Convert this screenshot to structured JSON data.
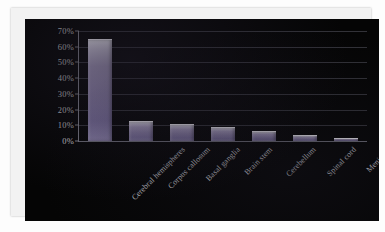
{
  "chart_data": {
    "type": "bar",
    "title": "",
    "subtitle": "",
    "xlabel": "",
    "ylabel": "",
    "categories": [
      "Cerebral hemispheres",
      "Corpus callosum",
      "Basal ganglia",
      "Brain stem",
      "Cerebellum",
      "Spinal cord",
      "Meninges"
    ],
    "values": [
      64,
      12,
      10,
      8,
      6,
      3,
      1
    ],
    "value_labels": [
      "64%",
      "12%",
      "10%",
      "8%",
      "6%",
      "3%",
      "1%"
    ],
    "ylim": [
      0,
      70
    ],
    "ytick_labels": [
      "0%",
      "10%",
      "20%",
      "30%",
      "40%",
      "50%",
      "60%",
      "70%"
    ],
    "ytick_values": [
      0,
      10,
      20,
      30,
      40,
      50,
      60,
      70
    ],
    "grid": true,
    "legend": false,
    "legend_position": "none",
    "series": [
      {
        "name": "",
        "values": [
          64,
          12,
          10,
          8,
          6,
          3,
          1
        ]
      }
    ]
  },
  "style": {
    "plot_background": "#050505",
    "page_background": "#fdfdfd",
    "bar_color": "#8d82ab",
    "bar_highlight": "#e8e6f0",
    "gridline_color": "#3a3a42",
    "axis_color": "#7b7b85",
    "tick_label_color": "#cfcfd4",
    "category_label_color": "#c9c9cf"
  }
}
